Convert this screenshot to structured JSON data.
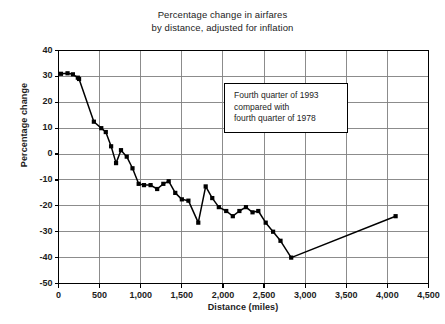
{
  "chart_data": {
    "type": "line",
    "title": "Percentage change in airfares by distance, adjusted for inflation",
    "title_lines": [
      "Percentage change in airfares",
      "by distance, adjusted for inflation"
    ],
    "xlabel": "Distance (miles)",
    "ylabel": "Percentage change",
    "xlim": [
      0,
      4500
    ],
    "ylim": [
      -50,
      40
    ],
    "xticks": [
      0,
      500,
      1000,
      1500,
      2000,
      2500,
      3000,
      3500,
      4000,
      4500
    ],
    "xtick_labels": [
      "0",
      "500",
      "1,000",
      "1,500",
      "2,000",
      "2,500",
      "3,000",
      "3,500",
      "4,000",
      "4,500"
    ],
    "yticks": [
      40,
      30,
      20,
      10,
      0,
      -10,
      -20,
      -30,
      -40,
      -50
    ],
    "ytick_labels": [
      "40",
      "30",
      "20",
      "10",
      "0",
      "-10",
      "-20",
      "-30",
      "-40",
      "-50"
    ],
    "grid": true,
    "legend": false,
    "marker": "square",
    "line_color": "#000000",
    "marker_color": "#000000",
    "grid_color": "#808080",
    "axis_color": "#000000",
    "series": [
      {
        "name": "Percentage change in airfares",
        "points": [
          [
            30,
            31.0
          ],
          [
            110,
            31.2
          ],
          [
            175,
            30.8
          ],
          [
            235,
            29.5
          ],
          [
            250,
            29.0
          ],
          [
            430,
            12.5
          ],
          [
            520,
            10.0
          ],
          [
            575,
            8.5
          ],
          [
            640,
            3.0
          ],
          [
            700,
            -3.5
          ],
          [
            760,
            1.5
          ],
          [
            830,
            -1.0
          ],
          [
            900,
            -5.5
          ],
          [
            975,
            -11.5
          ],
          [
            1040,
            -12.0
          ],
          [
            1120,
            -12.0
          ],
          [
            1200,
            -13.5
          ],
          [
            1275,
            -11.5
          ],
          [
            1340,
            -10.5
          ],
          [
            1420,
            -15.0
          ],
          [
            1500,
            -17.5
          ],
          [
            1580,
            -18.0
          ],
          [
            1700,
            -26.5
          ],
          [
            1790,
            -12.5
          ],
          [
            1870,
            -17.0
          ],
          [
            1950,
            -20.5
          ],
          [
            2040,
            -22.0
          ],
          [
            2120,
            -24.0
          ],
          [
            2200,
            -22.0
          ],
          [
            2280,
            -20.5
          ],
          [
            2360,
            -22.5
          ],
          [
            2430,
            -22.0
          ],
          [
            2520,
            -26.5
          ],
          [
            2610,
            -30.0
          ],
          [
            2700,
            -33.5
          ],
          [
            2830,
            -40.0
          ],
          [
            4100,
            -24.0
          ]
        ]
      }
    ],
    "annotation": {
      "lines": [
        "Fourth quarter of 1993",
        "compared with",
        "fourth quarter of 1978"
      ]
    }
  }
}
